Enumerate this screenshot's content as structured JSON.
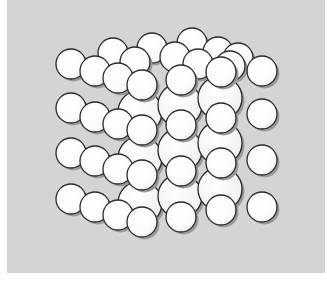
{
  "figure": {
    "colors": {
      "panel_background": "#d4d4d4",
      "sphere_fill": "#ffffff",
      "sphere_outline": "#2a2a2a",
      "sphere_shadow": "#9a9a9a",
      "page_background": "#ffffff"
    },
    "sphere_radius": 15,
    "back_sphere_radius": 22,
    "layers": {
      "back_large": [
        [
          140,
          112
        ],
        [
          180,
          105
        ],
        [
          220,
          98
        ],
        [
          140,
          158
        ],
        [
          180,
          150
        ],
        [
          220,
          143
        ],
        [
          140,
          203
        ],
        [
          180,
          196
        ],
        [
          220,
          189
        ]
      ],
      "top_back": [
        [
          113,
          53
        ],
        [
          152,
          48
        ],
        [
          192,
          43
        ],
        [
          218,
          52
        ],
        [
          238,
          58
        ],
        [
          135,
          62
        ],
        [
          175,
          57
        ],
        [
          198,
          64
        ],
        [
          230,
          66
        ]
      ],
      "front": [
        [
          71,
          64
        ],
        [
          71,
          108
        ],
        [
          71,
          153
        ],
        [
          71,
          199
        ],
        [
          95,
          71
        ],
        [
          95,
          117
        ],
        [
          95,
          161
        ],
        [
          95,
          207
        ],
        [
          118,
          78
        ],
        [
          118,
          124
        ],
        [
          118,
          169
        ],
        [
          118,
          215
        ],
        [
          142,
          85
        ],
        [
          142,
          130
        ],
        [
          142,
          175
        ],
        [
          142,
          222
        ],
        [
          181,
          80
        ],
        [
          181,
          125
        ],
        [
          181,
          171
        ],
        [
          181,
          217
        ],
        [
          221,
          72
        ],
        [
          221,
          118
        ],
        [
          221,
          163
        ],
        [
          221,
          210
        ],
        [
          262,
          71
        ],
        [
          262,
          114
        ],
        [
          262,
          160
        ],
        [
          262,
          207
        ]
      ]
    }
  }
}
